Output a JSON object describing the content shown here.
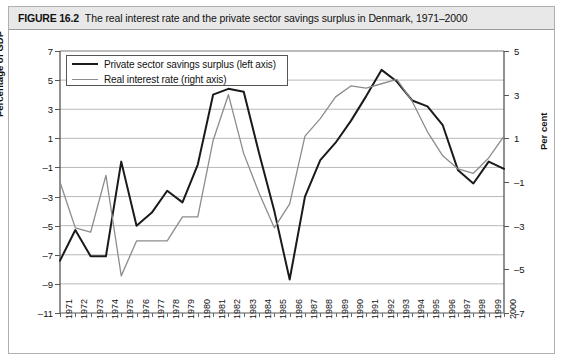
{
  "caption": {
    "figure_number": "FIGURE 16.2",
    "title": "The real interest rate and the private sector savings surplus in Denmark, 1971–2000"
  },
  "legend": {
    "items": [
      {
        "label": "Private sector savings surplus (left axis)",
        "color": "#1a1a1a"
      },
      {
        "label": "Real interest rate (right axis)",
        "color": "#8c8c8c"
      }
    ]
  },
  "axes": {
    "left_title": "Percentage of GDP",
    "right_title": "Per cent",
    "left_ticks": [
      "7",
      "5",
      "3",
      "1",
      "–1",
      "–3",
      "–5",
      "–7",
      "–9",
      "–11"
    ],
    "right_ticks": [
      "5",
      "3",
      "1",
      "–1",
      "–3",
      "–5",
      "–7"
    ]
  },
  "chart_data": {
    "type": "line",
    "title": "The real interest rate and the private sector savings surplus in Denmark, 1971–2000",
    "xlabel": "",
    "ylabel": "Percentage of GDP",
    "y2label": "Per cent",
    "ylim": [
      -11,
      7
    ],
    "y2lim": [
      -7,
      5
    ],
    "ytick_step": 2,
    "grid": true,
    "legend_position": "top-left",
    "categories": [
      "1971",
      "1972",
      "1973",
      "1974",
      "1975",
      "1976",
      "1977",
      "1978",
      "1979",
      "1980",
      "1981",
      "1982",
      "1983",
      "1984",
      "1985",
      "1986",
      "1987",
      "1988",
      "1989",
      "1990",
      "1991",
      "1992",
      "1993",
      "1994",
      "1995",
      "1996",
      "1997",
      "1998",
      "1999",
      "2000"
    ],
    "series": [
      {
        "name": "Private sector savings surplus (left axis)",
        "axis": "left",
        "color": "#1a1a1a",
        "values": [
          -7.4,
          -5.3,
          -7.1,
          -7.1,
          -0.6,
          -5.0,
          -4.1,
          -2.6,
          -3.4,
          -0.8,
          4.0,
          4.4,
          4.2,
          0.0,
          -4.0,
          -8.7,
          -3.0,
          -0.5,
          0.7,
          2.2,
          3.9,
          5.7,
          4.9,
          3.6,
          3.2,
          1.9,
          -1.2,
          -2.1,
          -0.6,
          -1.1
        ]
      },
      {
        "name": "Real interest rate (right axis)",
        "axis": "right",
        "color": "#8c8c8c",
        "values": [
          -1.0,
          -3.1,
          -3.3,
          -0.7,
          -5.3,
          -3.7,
          -3.7,
          -3.7,
          -2.6,
          -2.6,
          0.9,
          3.0,
          0.3,
          -1.5,
          -3.1,
          -2.0,
          1.1,
          1.9,
          2.9,
          3.4,
          3.3,
          3.5,
          3.7,
          2.7,
          1.3,
          0.2,
          -0.4,
          -0.6,
          0.1,
          1.1
        ]
      }
    ]
  }
}
